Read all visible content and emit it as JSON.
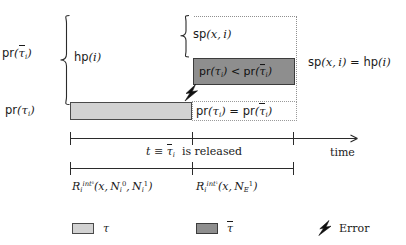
{
  "figure": {
    "type": "timing-diagram",
    "axis_labels": {
      "time_axis_label": "time",
      "release_event_label": "t ≡ τ̄ᵢ is released"
    },
    "left_labels": {
      "priority_taubar": "pr(τ̄ᵢ)",
      "priority_tau": "pr(τᵢ)"
    },
    "brace_labels": {
      "hp": "hp(i)",
      "sp": "sp(x, i)"
    },
    "annotations": {
      "sp_equals_hp": "sp(x, i) = hp(i)",
      "pr_less_than": "pr(τᵢ) < pr(τ̄ᵢ)",
      "pr_equals": "pr(τᵢ) = pr(τ̄ᵢ)"
    },
    "interval_labels": {
      "interval_0": "Rᵢ^{int^0}(x, Nᵢ^0, Nᵢ^1)",
      "interval_1": "Rᵢ^{int^1}(x, N_E^1)"
    },
    "legend": [
      {
        "swatch": "light-gray-box",
        "label": "τ"
      },
      {
        "swatch": "dark-gray-box",
        "label": "τ̄"
      },
      {
        "swatch": "lightning-bolt",
        "label": "Error"
      }
    ],
    "colors": {
      "tau_fill": "#d2d2d2",
      "taubar_fill": "#8e8e8e",
      "stroke": "#2b2b2b",
      "dotted": "#8f8f8f",
      "background": "#ffffff"
    }
  }
}
